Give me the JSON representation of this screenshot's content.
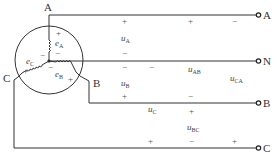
{
  "diagram": {
    "type": "three-phase star-connected generator (Y) with four-wire output",
    "generator": {
      "center_node": "neutral point",
      "windings": [
        {
          "emf": "e",
          "sub": "A",
          "plus_label": "+",
          "minus_label": "−"
        },
        {
          "emf": "e",
          "sub": "B",
          "plus_label": "+",
          "minus_label": "−"
        },
        {
          "emf": "e",
          "sub": "C",
          "plus_label": "+",
          "minus_label": "−"
        }
      ],
      "terminal_labels": {
        "A": "A",
        "B": "B",
        "C": "C"
      }
    },
    "lines": [
      {
        "id": "A",
        "label": "A"
      },
      {
        "id": "N",
        "label": "N"
      },
      {
        "id": "B",
        "label": "B"
      },
      {
        "id": "C",
        "label": "C"
      }
    ],
    "voltages": {
      "phase": [
        {
          "name": "u",
          "sub": "A",
          "plus": "+",
          "minus": "−"
        },
        {
          "name": "u",
          "sub": "B",
          "plus": "+",
          "minus": "−"
        },
        {
          "name": "u",
          "sub": "C",
          "plus": "+",
          "minus": "−"
        }
      ],
      "line": [
        {
          "name": "u",
          "sub": "AB",
          "plus": "+",
          "minus": "−"
        },
        {
          "name": "u",
          "sub": "BC",
          "plus": "+",
          "minus": "−"
        },
        {
          "name": "u",
          "sub": "CA",
          "plus": "+",
          "minus": "−"
        }
      ]
    },
    "signs": {
      "plus": "+",
      "minus": "−"
    },
    "colors": {
      "line": "#333333",
      "background": "#ffffff"
    }
  }
}
